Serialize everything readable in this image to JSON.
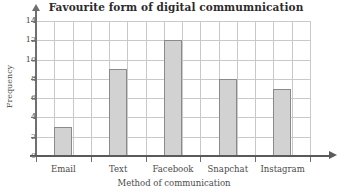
{
  "chart_data": {
    "type": "bar",
    "title": "Favourite form of digital commumnication",
    "xlabel": "Method of communication",
    "ylabel": "Frequency",
    "categories": [
      "Email",
      "Text",
      "Facebook",
      "Snapchat",
      "Instagram"
    ],
    "values": [
      3,
      9,
      12,
      8,
      7
    ],
    "ylim": [
      0,
      14
    ],
    "yticks": [
      0,
      2,
      4,
      6,
      8,
      10,
      12,
      14
    ],
    "ytick_labels": [
      "0",
      "2",
      "4",
      "6",
      "8",
      "10",
      "12",
      "14"
    ],
    "grid": true,
    "grid_minor_vertical": true,
    "legend": null,
    "bar_fill_color": "#d2d2d2",
    "bar_edge_color": "#8a8a8a",
    "grid_color": "#c9c9c9",
    "axis_color": "#5a5a5a",
    "background_color": "#ffffff"
  }
}
